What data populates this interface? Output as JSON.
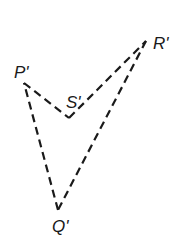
{
  "diagram": {
    "type": "quadrilateral",
    "line_style": "dashed",
    "stroke_color": "#1a1a1a",
    "background": "#ffffff",
    "vertices": {
      "P": {
        "label": "P'",
        "x": 24,
        "y": 83
      },
      "S": {
        "label": "S'",
        "x": 69,
        "y": 118
      },
      "R": {
        "label": "R'",
        "x": 146,
        "y": 41
      },
      "Q": {
        "label": "Q'",
        "x": 58,
        "y": 210
      }
    },
    "edges": [
      [
        "P",
        "S"
      ],
      [
        "S",
        "R"
      ],
      [
        "R",
        "Q"
      ],
      [
        "Q",
        "P"
      ]
    ]
  }
}
